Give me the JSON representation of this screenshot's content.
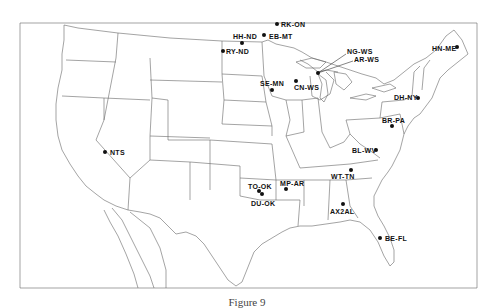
{
  "figure": {
    "caption": "Figure 9",
    "frame": {
      "x": 20,
      "y": 23,
      "width": 457,
      "height": 265
    },
    "line_color": "#555555",
    "marker_color": "#111111"
  },
  "sites": [
    {
      "id": "RK-ON",
      "label": "RK-ON",
      "dot": [
        277,
        24
      ],
      "label_pos": [
        281,
        21
      ]
    },
    {
      "id": "EB-MT",
      "label": "EB-MT",
      "dot": [
        264,
        35
      ],
      "label_pos": [
        269,
        33
      ]
    },
    {
      "id": "HH-ND",
      "label": "HH-ND",
      "dot": [
        242,
        43
      ],
      "label_pos": [
        233,
        33
      ]
    },
    {
      "id": "RY-ND",
      "label": "RY-ND",
      "dot": [
        223,
        51
      ],
      "label_pos": [
        226,
        48
      ]
    },
    {
      "id": "NG-WS",
      "label": "NG-WS",
      "dot": [
        318,
        73
      ],
      "label_pos": [
        347,
        48
      ]
    },
    {
      "id": "AR-WS",
      "label": "AR-WS",
      "dot": [
        318,
        73
      ],
      "label_pos": [
        354,
        56
      ]
    },
    {
      "id": "SE-MN",
      "label": "SE-MN",
      "dot": [
        272,
        90
      ],
      "label_pos": [
        260,
        80
      ]
    },
    {
      "id": "CN-WS",
      "label": "CN-WS",
      "dot": [
        296,
        81
      ],
      "label_pos": [
        294,
        84
      ]
    },
    {
      "id": "HN-ME",
      "label": "HN-ME",
      "dot": [
        457,
        47
      ],
      "label_pos": [
        432,
        45
      ]
    },
    {
      "id": "DH-NY",
      "label": "DH-NY",
      "dot": [
        418,
        98
      ],
      "label_pos": [
        394,
        94
      ]
    },
    {
      "id": "BR-PA",
      "label": "BR-PA",
      "dot": [
        392,
        126
      ],
      "label_pos": [
        382,
        117
      ]
    },
    {
      "id": "BL-WV",
      "label": "BL-WV",
      "dot": [
        376,
        150
      ],
      "label_pos": [
        352,
        147
      ]
    },
    {
      "id": "WT-TN",
      "label": "WT-TN",
      "dot": [
        351,
        170
      ],
      "label_pos": [
        331,
        173
      ]
    },
    {
      "id": "NTS",
      "label": "NTS",
      "dot": [
        105,
        152
      ],
      "label_pos": [
        110,
        149
      ]
    },
    {
      "id": "TO-OK",
      "label": "TO-OK",
      "dot": [
        259,
        191
      ],
      "label_pos": [
        248,
        183
      ]
    },
    {
      "id": "DU-OK",
      "label": "DU-OK",
      "dot": [
        262,
        194
      ],
      "label_pos": [
        251,
        200
      ]
    },
    {
      "id": "MP-AR",
      "label": "MP-AR",
      "dot": [
        286,
        189
      ],
      "label_pos": [
        280,
        180
      ]
    },
    {
      "id": "AX2AL",
      "label": "AX2AL",
      "dot": [
        343,
        204
      ],
      "label_pos": [
        330,
        208
      ]
    },
    {
      "id": "BE-FL",
      "label": "BE-FL",
      "dot": [
        380,
        238
      ],
      "label_pos": [
        385,
        235
      ]
    }
  ]
}
